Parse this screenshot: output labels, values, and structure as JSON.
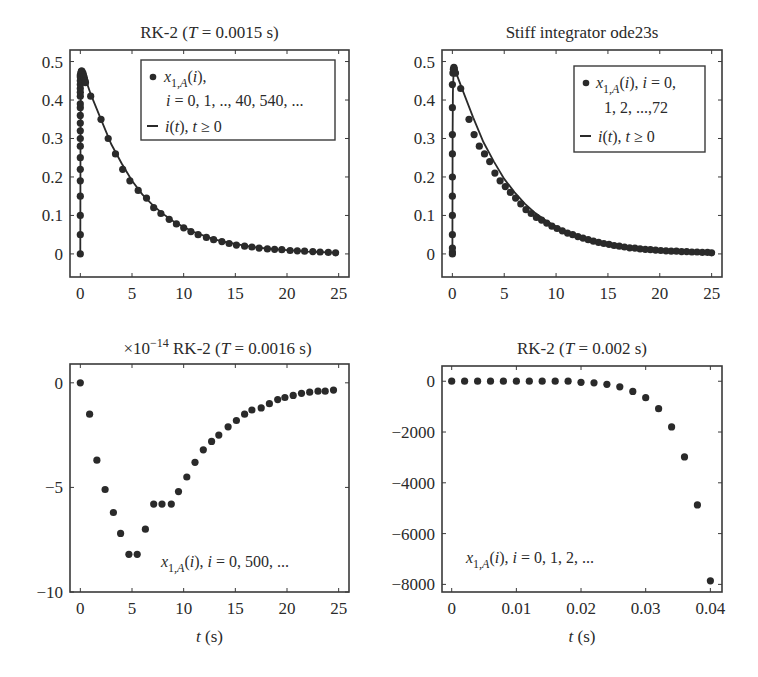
{
  "chart_data": [
    {
      "id": "tl",
      "type": "line",
      "title": "RK-2 (T = 0.0015 s)",
      "title_parts": [
        "RK-2 (",
        "T",
        " = 0.0015 s)"
      ],
      "xlabel": "",
      "ylabel": "",
      "xlim": [
        -1,
        26
      ],
      "ylim": [
        -0.06,
        0.53
      ],
      "xticks": [
        0,
        5,
        10,
        15,
        20,
        25
      ],
      "xtick_labels": [
        "0",
        "5",
        "10",
        "15",
        "20",
        "25"
      ],
      "yticks": [
        0,
        0.1,
        0.2,
        0.3,
        0.4,
        0.5
      ],
      "ytick_labels": [
        "0",
        "0.1",
        "0.2",
        "0.3",
        "0.4",
        "0.5"
      ],
      "grid": false,
      "legend": {
        "position": "upper right",
        "entries": [
          {
            "marker": "dot",
            "text": "x1,A(i),",
            "line2": "i = 0, 1, .., 40, 540, ..."
          },
          {
            "marker": "line",
            "text": "i(t), t ≥ 0"
          }
        ]
      },
      "series": [
        {
          "name": "x1,A(i), i = 0, 1, .., 40, 540, ...",
          "style": "dots",
          "x": [
            0,
            0,
            0,
            0,
            0,
            0,
            0,
            0,
            0,
            0,
            0,
            0,
            0,
            0,
            0,
            0,
            0,
            0,
            0,
            0,
            0,
            0.05,
            0.1,
            0.15,
            0.2,
            0.25,
            0.3,
            0.35,
            0.4,
            0.45,
            0.5,
            1.0,
            2.0,
            2.7,
            3.4,
            4.1,
            4.8,
            5.6,
            6.4,
            7.1,
            7.8,
            8.6,
            9.3,
            10.0,
            10.7,
            11.4,
            12.2,
            12.9,
            13.7,
            14.4,
            15.1,
            15.9,
            16.6,
            17.3,
            18.1,
            18.8,
            19.5,
            20.3,
            21.0,
            21.7,
            22.5,
            23.2,
            24.0,
            24.7
          ],
          "y": [
            0,
            0.05,
            0.1,
            0.15,
            0.19,
            0.22,
            0.25,
            0.28,
            0.3,
            0.32,
            0.34,
            0.36,
            0.38,
            0.39,
            0.41,
            0.42,
            0.43,
            0.44,
            0.45,
            0.46,
            0.465,
            0.47,
            0.475,
            0.475,
            0.47,
            0.47,
            0.465,
            0.46,
            0.455,
            0.45,
            0.445,
            0.41,
            0.35,
            0.3,
            0.26,
            0.22,
            0.19,
            0.165,
            0.145,
            0.12,
            0.105,
            0.09,
            0.078,
            0.068,
            0.058,
            0.05,
            0.043,
            0.037,
            0.032,
            0.027,
            0.023,
            0.02,
            0.018,
            0.015,
            0.013,
            0.012,
            0.011,
            0.009,
            0.008,
            0.007,
            0.006,
            0.005,
            0.004,
            0.003
          ]
        },
        {
          "name": "i(t), t ≥ 0",
          "style": "line",
          "x": [
            0,
            0.02,
            0.05,
            0.1,
            0.2,
            0.3,
            0.5,
            1,
            2,
            3,
            4,
            5,
            6,
            7,
            8,
            9,
            10,
            11,
            12,
            13,
            14,
            15,
            16,
            17,
            18,
            19,
            20,
            21,
            22,
            23,
            24,
            25
          ],
          "y": [
            0,
            0.3,
            0.42,
            0.46,
            0.475,
            0.47,
            0.455,
            0.415,
            0.35,
            0.285,
            0.235,
            0.19,
            0.155,
            0.127,
            0.104,
            0.085,
            0.07,
            0.057,
            0.047,
            0.038,
            0.031,
            0.026,
            0.021,
            0.017,
            0.014,
            0.012,
            0.01,
            0.008,
            0.006,
            0.005,
            0.004,
            0.003
          ]
        }
      ]
    },
    {
      "id": "tr",
      "type": "line",
      "title": "Stiff integrator ode23s",
      "title_parts": [
        "Stiff integrator ode23s",
        "",
        ""
      ],
      "xlabel": "",
      "ylabel": "",
      "xlim": [
        -1,
        26
      ],
      "ylim": [
        -0.06,
        0.53
      ],
      "xticks": [
        0,
        5,
        10,
        15,
        20,
        25
      ],
      "xtick_labels": [
        "0",
        "5",
        "10",
        "15",
        "20",
        "25"
      ],
      "yticks": [
        0,
        0.1,
        0.2,
        0.3,
        0.4,
        0.5
      ],
      "ytick_labels": [
        "0",
        "0.1",
        "0.2",
        "0.3",
        "0.4",
        "0.5"
      ],
      "grid": false,
      "legend": {
        "position": "upper right",
        "entries": [
          {
            "marker": "dot",
            "text": "x1,A(i), i = 0,",
            "line2": "1, 2, ...,72"
          },
          {
            "marker": "line",
            "text": "i(t), t ≥ 0"
          }
        ]
      },
      "series": [
        {
          "name": "x1,A(i), i = 0, 1, 2, ..., 72",
          "style": "dots",
          "x": [
            0,
            0,
            0,
            0,
            0,
            0,
            0,
            0,
            0,
            0,
            0,
            0.05,
            0.1,
            0.15,
            0.2,
            0.3,
            0.8,
            1.6,
            2.1,
            2.6,
            3.1,
            3.6,
            4.1,
            4.6,
            5.1,
            5.6,
            6.1,
            6.6,
            7.1,
            7.6,
            8.1,
            8.6,
            9.1,
            9.6,
            10.1,
            10.6,
            11.1,
            11.6,
            12.1,
            12.6,
            13.1,
            13.6,
            14.1,
            14.6,
            15.1,
            15.6,
            16.1,
            16.6,
            17.1,
            17.6,
            18.1,
            18.6,
            19.1,
            19.6,
            20.1,
            20.6,
            21.1,
            21.6,
            22.1,
            22.6,
            23.1,
            23.6,
            24.1,
            24.6,
            25
          ],
          "y": [
            0,
            0.005,
            0.015,
            0.05,
            0.1,
            0.15,
            0.2,
            0.26,
            0.31,
            0.38,
            0.44,
            0.47,
            0.48,
            0.485,
            0.48,
            0.47,
            0.43,
            0.35,
            0.31,
            0.28,
            0.26,
            0.24,
            0.21,
            0.19,
            0.175,
            0.16,
            0.145,
            0.13,
            0.115,
            0.105,
            0.095,
            0.088,
            0.08,
            0.072,
            0.066,
            0.06,
            0.054,
            0.05,
            0.045,
            0.041,
            0.037,
            0.033,
            0.03,
            0.027,
            0.025,
            0.022,
            0.02,
            0.018,
            0.016,
            0.015,
            0.013,
            0.012,
            0.011,
            0.01,
            0.009,
            0.008,
            0.007,
            0.007,
            0.006,
            0.006,
            0.005,
            0.005,
            0.004,
            0.004,
            0.003
          ]
        },
        {
          "name": "i(t), t ≥ 0",
          "style": "line",
          "x": [
            0,
            0.02,
            0.05,
            0.1,
            0.2,
            0.3,
            0.5,
            1,
            2,
            3,
            4,
            5,
            6,
            7,
            8,
            9,
            10,
            11,
            12,
            13,
            14,
            15,
            16,
            17,
            18,
            19,
            20,
            21,
            22,
            23,
            24,
            25
          ],
          "y": [
            0,
            0.3,
            0.42,
            0.46,
            0.478,
            0.475,
            0.46,
            0.425,
            0.355,
            0.29,
            0.24,
            0.195,
            0.16,
            0.13,
            0.106,
            0.087,
            0.071,
            0.058,
            0.048,
            0.039,
            0.032,
            0.026,
            0.021,
            0.017,
            0.014,
            0.012,
            0.01,
            0.008,
            0.006,
            0.005,
            0.004,
            0.003
          ]
        }
      ]
    },
    {
      "id": "bl",
      "type": "scatter",
      "title": "×10^-14 RK-2 (T = 0.0016 s)",
      "title_parts": [
        "RK-2 (",
        "T",
        " = 0.0016 s)"
      ],
      "scale_prefix": "×10",
      "scale_exponent": "−14",
      "xlabel": "t (s)",
      "ylabel": "",
      "xlim": [
        -1,
        26
      ],
      "ylim": [
        -10,
        0.9
      ],
      "xticks": [
        0,
        5,
        10,
        15,
        20,
        25
      ],
      "xtick_labels": [
        "0",
        "5",
        "10",
        "15",
        "20",
        "25"
      ],
      "yticks": [
        -10,
        -5,
        0
      ],
      "ytick_labels": [
        "−10",
        "−5",
        "0"
      ],
      "grid": false,
      "annotation": "x1,A(i), i = 0, 500, ...",
      "series": [
        {
          "name": "x1,A(i), i = 0, 500, ...",
          "style": "dots",
          "x": [
            0,
            0.9,
            1.6,
            2.4,
            3.2,
            3.9,
            4.7,
            5.5,
            6.3,
            7.1,
            7.9,
            8.8,
            9.5,
            10.3,
            11.1,
            11.9,
            12.7,
            13.4,
            14.3,
            15.1,
            15.9,
            16.6,
            17.5,
            18.3,
            19.1,
            19.8,
            20.6,
            21.4,
            22.2,
            23.0,
            23.7,
            24.5
          ],
          "y": [
            0,
            -1.5,
            -3.7,
            -5.1,
            -6.2,
            -7.2,
            -8.2,
            -8.2,
            -7.0,
            -5.8,
            -5.8,
            -5.8,
            -5.2,
            -4.5,
            -3.8,
            -3.2,
            -2.8,
            -2.5,
            -2.1,
            -1.8,
            -1.5,
            -1.3,
            -1.2,
            -1.0,
            -0.8,
            -0.7,
            -0.6,
            -0.5,
            -0.45,
            -0.4,
            -0.4,
            -0.35
          ]
        }
      ]
    },
    {
      "id": "br",
      "type": "scatter",
      "title": "RK-2 (T = 0.002 s)",
      "title_parts": [
        "RK-2 (",
        "T",
        " = 0.002 s)"
      ],
      "xlabel": "t (s)",
      "ylabel": "",
      "xlim": [
        -0.0015,
        0.0418
      ],
      "ylim": [
        -8300,
        600
      ],
      "xticks": [
        0,
        0.01,
        0.02,
        0.03,
        0.04
      ],
      "xtick_labels": [
        "0",
        "0.01",
        "0.02",
        "0.03",
        "0.04"
      ],
      "yticks": [
        -8000,
        -6000,
        -4000,
        -2000,
        0
      ],
      "ytick_labels": [
        "−8000",
        "−6000",
        "−4000",
        "−2000",
        "0"
      ],
      "grid": false,
      "annotation": "x1,A(i), i = 0, 1, 2, ...",
      "series": [
        {
          "name": "x1,A(i), i = 0, 1, 2, ...",
          "style": "dots",
          "x": [
            0,
            0.002,
            0.004,
            0.006,
            0.008,
            0.01,
            0.012,
            0.014,
            0.016,
            0.018,
            0.02,
            0.022,
            0.024,
            0.026,
            0.028,
            0.03,
            0.032,
            0.034,
            0.036,
            0.038,
            0.04
          ],
          "y": [
            0,
            0,
            0,
            0,
            0,
            0,
            0,
            0,
            0,
            0,
            -40,
            -60,
            -120,
            -220,
            -400,
            -650,
            -1080,
            -1800,
            -2980,
            -4870,
            -7860
          ]
        }
      ]
    }
  ],
  "layout": {
    "panels": [
      {
        "id": "tl",
        "frame": [
          70,
          50,
          349,
          277
        ]
      },
      {
        "id": "tr",
        "frame": [
          442,
          50,
          722,
          277
        ]
      },
      {
        "id": "bl",
        "frame": [
          70,
          364,
          349,
          592
        ]
      },
      {
        "id": "br",
        "frame": [
          442,
          366,
          722,
          592
        ]
      }
    ],
    "ink_color": "#2a2a2a",
    "frame_color": "#3a3a3a",
    "background": "#ffffff"
  }
}
